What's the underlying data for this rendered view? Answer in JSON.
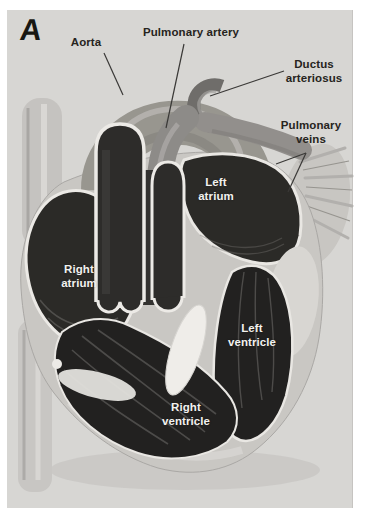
{
  "figure": {
    "panel_letter": "A",
    "callouts": {
      "aorta": "Aorta",
      "pulmonary_artery": "Pulmonary artery",
      "ductus_arteriosus": "Ductus arteriosus",
      "pulmonary_veins": "Pulmonary veins"
    },
    "chamber_labels": {
      "left_atrium": "Left atrium",
      "right_atrium": "Right atrium",
      "left_ventricle": "Left ventricle",
      "right_ventricle": "Right ventricle"
    },
    "colors": {
      "background": "#d7d6d3",
      "page": "#ffffff",
      "heart_wall": "#c9c7c3",
      "atrium_dark": "#2b2a27",
      "ventricle_dark": "#222120",
      "vessel_lumen": "#2d2c2a",
      "artery_gray": "#98968f",
      "rim_white": "#eceae6",
      "label_dark": "#262420",
      "label_light": "#f2f1ee"
    }
  }
}
